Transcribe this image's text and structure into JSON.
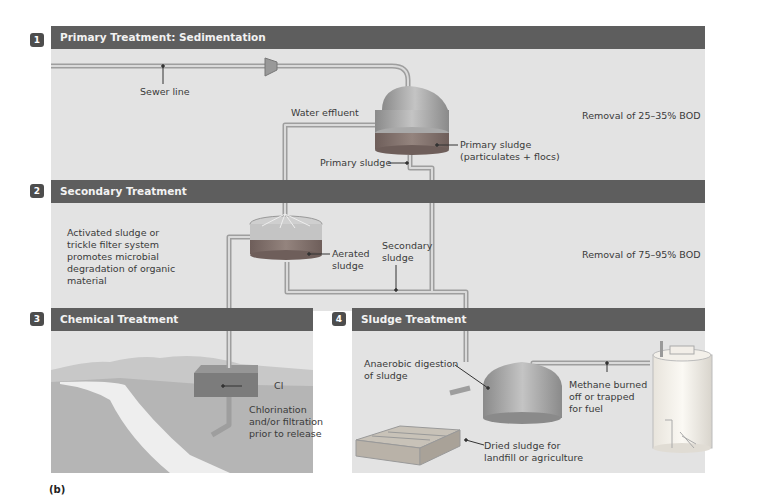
{
  "figure_label": "(b)",
  "sections": [
    {
      "number": "1",
      "title": "Primary Treatment: Sedimentation",
      "note": "Removal of 25–35% BOD"
    },
    {
      "number": "2",
      "title": "Secondary Treatment",
      "note": "Removal of 75–95% BOD",
      "description": "Activated sludge or\ntrickle filter system\npromotes microbial\ndegradation of organic\nmaterial"
    },
    {
      "number": "3",
      "title": "Chemical Treatment"
    },
    {
      "number": "4",
      "title": "Sludge Treatment"
    }
  ],
  "labels": {
    "sewer_line": "Sewer line",
    "water_effluent": "Water effluent",
    "primary_sludge_tank": "Primary sludge\n(particulates + flocs)",
    "primary_sludge_pipe": "Primary sludge",
    "aerated_sludge": "Aerated\nsludge",
    "secondary_sludge": "Secondary\nsludge",
    "cl": "Cl",
    "chlorination": "Chlorination\nand/or filtration\nprior to release",
    "anaerobic_digestion": "Anaerobic digestion\nof sludge",
    "methane": "Methane burned\noff or trapped\nfor fuel",
    "dried_sludge": "Dried sludge for\nlandfill or agriculture"
  },
  "colors": {
    "panel_bg": "#e3e3e3",
    "header_bg": "#5e5e5e",
    "badge_bg": "#4d4d4d",
    "pipe": "#b8b8b8",
    "tank": "#9a9a9a",
    "sludge": "#7a6a66"
  }
}
